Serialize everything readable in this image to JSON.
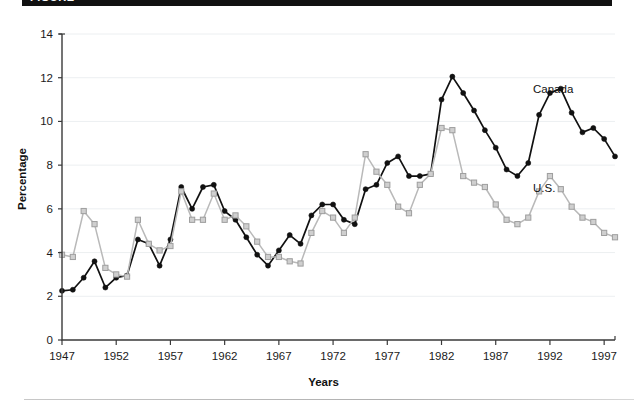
{
  "figure": {
    "banner_text": "FIGURE",
    "banner_color": "#111111"
  },
  "chart_data": {
    "type": "line",
    "title": "",
    "xlabel": "Years",
    "ylabel": "Percentage",
    "xlim": [
      1947,
      1998
    ],
    "ylim": [
      0,
      14
    ],
    "xticks": [
      1947,
      1952,
      1957,
      1962,
      1967,
      1972,
      1977,
      1982,
      1987,
      1992,
      1997
    ],
    "xtick_labels": [
      "1947",
      "1952",
      "1957",
      "1962",
      "1967",
      "1972",
      "1977",
      "1982",
      "1987",
      "1992",
      "1997"
    ],
    "yticks": [
      0,
      2,
      4,
      6,
      8,
      10,
      12,
      14
    ],
    "ytick_labels": [
      "0",
      "2",
      "4",
      "6",
      "8",
      "10",
      "12",
      "14"
    ],
    "grid": "horizontal",
    "legend_position": "inline-right",
    "x": [
      1947,
      1948,
      1949,
      1950,
      1951,
      1952,
      1953,
      1954,
      1955,
      1956,
      1957,
      1958,
      1959,
      1960,
      1961,
      1962,
      1963,
      1964,
      1965,
      1966,
      1967,
      1968,
      1969,
      1970,
      1971,
      1972,
      1973,
      1974,
      1975,
      1976,
      1977,
      1978,
      1979,
      1980,
      1981,
      1982,
      1983,
      1984,
      1985,
      1986,
      1987,
      1988,
      1989,
      1990,
      1991,
      1992,
      1993,
      1994,
      1995,
      1996,
      1997,
      1998
    ],
    "series": [
      {
        "name": "Canada",
        "color": "#111111",
        "marker": "filled-circle",
        "label": "Canada",
        "values": [
          2.25,
          2.3,
          2.85,
          3.6,
          2.4,
          2.85,
          2.95,
          4.6,
          4.4,
          3.4,
          4.6,
          7.0,
          6.0,
          7.0,
          7.1,
          5.9,
          5.5,
          4.7,
          3.9,
          3.4,
          4.1,
          4.8,
          4.4,
          5.7,
          6.2,
          6.2,
          5.5,
          5.3,
          6.9,
          7.1,
          8.1,
          8.4,
          7.5,
          7.5,
          7.6,
          11.0,
          12.05,
          11.3,
          10.5,
          9.6,
          8.8,
          7.8,
          7.5,
          8.1,
          10.3,
          11.3,
          11.5,
          10.4,
          9.5,
          9.7,
          9.2,
          8.4
        ]
      },
      {
        "name": "U.S.",
        "color": "#c9c9c9",
        "marker": "open-square",
        "label": "U.S.",
        "values": [
          3.9,
          3.8,
          5.9,
          5.3,
          3.3,
          3.0,
          2.9,
          5.5,
          4.4,
          4.1,
          4.3,
          6.8,
          5.5,
          5.5,
          6.7,
          5.5,
          5.7,
          5.2,
          4.5,
          3.8,
          3.8,
          3.6,
          3.5,
          4.9,
          5.9,
          5.6,
          4.9,
          5.6,
          8.5,
          7.7,
          7.1,
          6.1,
          5.8,
          7.1,
          7.6,
          9.7,
          9.6,
          7.5,
          7.2,
          7.0,
          6.2,
          5.5,
          5.3,
          5.6,
          6.8,
          7.5,
          6.9,
          6.1,
          5.6,
          5.4,
          4.9,
          4.7
        ]
      }
    ]
  }
}
